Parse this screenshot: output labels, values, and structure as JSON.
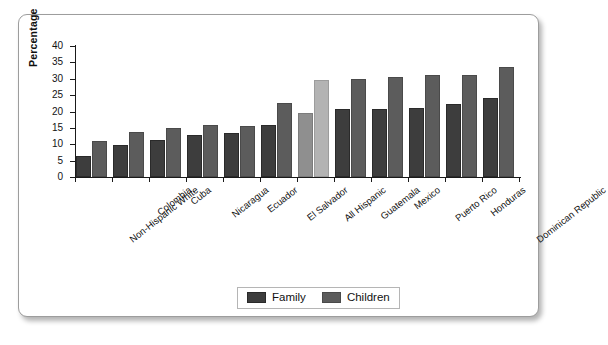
{
  "chart_data": {
    "type": "bar",
    "title": "",
    "xlabel": "",
    "ylabel": "Percentage",
    "ylim": [
      0,
      40
    ],
    "yticks": [
      0,
      5,
      10,
      15,
      20,
      25,
      30,
      35,
      40
    ],
    "grid": false,
    "legend_position": "bottom",
    "categories": [
      "Non-Hispanic White",
      "Colombia",
      "Cuba",
      "Nicaragua",
      "Ecuador",
      "El Salvador",
      "All Hispanic",
      "Guatemala",
      "Mexico",
      "Puerto Rico",
      "Honduras",
      "Dominican Republic"
    ],
    "highlighted_category": "All Hispanic",
    "series": [
      {
        "name": "Family",
        "color": "#3d3d3d",
        "values": [
          6.3,
          9.9,
          11.4,
          12.8,
          13.5,
          16.0,
          19.5,
          20.7,
          20.8,
          21.0,
          22.2,
          24.0
        ]
      },
      {
        "name": "Children",
        "color": "#5c5c5c",
        "values": [
          11.1,
          13.6,
          15.1,
          15.9,
          15.5,
          22.5,
          29.5,
          29.8,
          30.4,
          31.2,
          31.1,
          33.5
        ]
      }
    ]
  },
  "legend": {
    "items": [
      {
        "label": "Family"
      },
      {
        "label": "Children"
      }
    ]
  }
}
